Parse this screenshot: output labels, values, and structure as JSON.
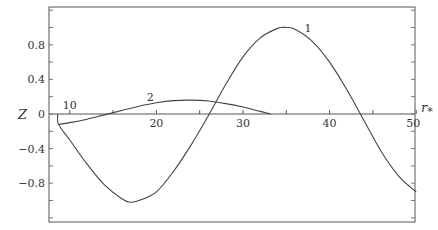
{
  "chart_data": {
    "type": "line",
    "title": "",
    "xlabel": "r_*",
    "ylabel": "Z",
    "xlim": [
      7.6,
      50
    ],
    "ylim": [
      -1.25,
      1.24
    ],
    "grid": false,
    "x_ticks": [
      "10",
      "20",
      "30",
      "40",
      "50"
    ],
    "y_ticks": [
      "0.8",
      "0.4",
      "0",
      "-0.4",
      "-0.8"
    ],
    "series": [
      {
        "name": "1",
        "x": [
          8.6,
          8.7,
          10,
          12,
          14,
          16,
          17,
          18,
          20,
          22,
          24,
          26,
          28,
          30,
          32,
          34,
          35,
          36,
          38,
          40,
          42,
          44,
          46,
          48,
          50
        ],
        "y": [
          0,
          -0.12,
          -0.3,
          -0.58,
          -0.82,
          -0.98,
          -1.02,
          -1.0,
          -0.9,
          -0.66,
          -0.36,
          -0.02,
          0.34,
          0.66,
          0.88,
          0.99,
          1.0,
          0.98,
          0.84,
          0.6,
          0.28,
          -0.08,
          -0.44,
          -0.72,
          -0.9
        ]
      },
      {
        "name": "2",
        "x": [
          8.7,
          10,
          12,
          14,
          16,
          18,
          20,
          22,
          24,
          26,
          28,
          30,
          32,
          33.2
        ],
        "y": [
          -0.12,
          -0.1,
          -0.06,
          -0.01,
          0.04,
          0.09,
          0.13,
          0.155,
          0.16,
          0.15,
          0.12,
          0.08,
          0.03,
          0.0
        ]
      }
    ],
    "annotations": [
      {
        "text": "1",
        "x": 37.5,
        "y": 1.0
      },
      {
        "text": "2",
        "x": 19.3,
        "y": 0.2
      },
      {
        "text": "10",
        "x": 10,
        "y": 0.1
      }
    ]
  }
}
